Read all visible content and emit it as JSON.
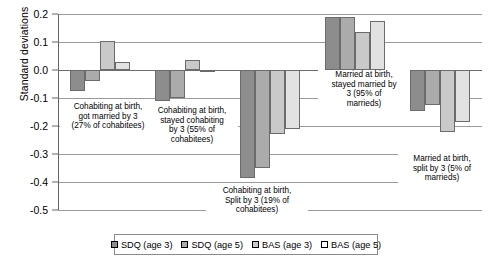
{
  "chart_data": {
    "type": "bar",
    "title": "",
    "xlabel": "",
    "ylabel": "Standard deviations",
    "ylim": [
      -0.5,
      0.2
    ],
    "yticks": [
      "0.2",
      "0.1",
      "0.0",
      "-0.1",
      "-0.2",
      "-0.3",
      "-0.4",
      "-0.5"
    ],
    "ytick_values": [
      0.2,
      0.1,
      0.0,
      -0.1,
      -0.2,
      -0.3,
      -0.4,
      -0.5
    ],
    "grid": true,
    "legend_position": "bottom",
    "categories": [
      "Cohabiting at birth, got married by 3 (27% of cohabitees)",
      "Cohabiting at birth, stayed cohabiting by 3 (55% of cohabitees)",
      "Cohabiting at birth, Split by 3 (19% of cohabitees)",
      "Married at birth, stayed married by 3 (95% of marrieds)",
      "Married at birth, split by 3 (5% of marrieds)"
    ],
    "series": [
      {
        "name": "SDQ (age 3)",
        "color": "#8d8d8d",
        "values": [
          -0.075,
          -0.11,
          -0.385,
          0.19,
          -0.145
        ]
      },
      {
        "name": "SDQ (age 5)",
        "color": "#ababab",
        "values": [
          -0.04,
          -0.1,
          -0.35,
          0.19,
          -0.125
        ]
      },
      {
        "name": "BAS (age 3)",
        "color": "#c9c9c9",
        "values": [
          0.105,
          0.037,
          -0.23,
          0.135,
          -0.22
        ]
      },
      {
        "name": "BAS (age 5)",
        "color": "#e2e2e2",
        "values": [
          0.03,
          -0.003,
          -0.21,
          0.175,
          -0.185
        ]
      }
    ],
    "annotations": [
      {
        "text": "Cohabiting at birth,\ngot married by 3\n(27% of cohabitees)"
      },
      {
        "text": "Cohabiting at birth,\nstayed cohabiting\nby 3 (55% of\ncohabitees)"
      },
      {
        "text": "Cohabiting at birth,\nSplit by 3 (19% of\ncohabitees)"
      },
      {
        "text": "Married at birth,\nstayed married by\n3 (95% of\nmarrieds)"
      },
      {
        "text": "Married at birth,\nsplit by 3 (5% of\nmarrieds)"
      }
    ]
  },
  "legend": {
    "items": [
      {
        "label": "SDQ (age 3)",
        "swatch": "sw1"
      },
      {
        "label": "SDQ (age 5)",
        "swatch": "sw2"
      },
      {
        "label": "BAS (age 3)",
        "swatch": "sw3"
      },
      {
        "label": "BAS (age 5)",
        "swatch": "sw4"
      }
    ]
  }
}
